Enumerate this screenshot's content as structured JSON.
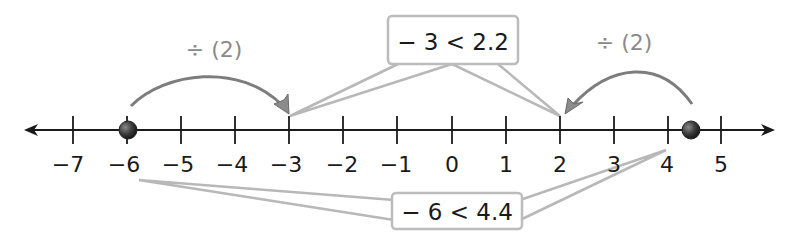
{
  "number_line": {
    "min": -7,
    "max": 5,
    "tick_labels": [
      "−7",
      "−6",
      "−5",
      "−4",
      "−3",
      "−2",
      "−1",
      "0",
      "1",
      "2",
      "3",
      "4",
      "5"
    ],
    "colors": {
      "axis": "#1a1a1a",
      "point": "#3a3a3a",
      "arc": "#7a7a7a",
      "callout_border": "#b5b5b5"
    }
  },
  "points": [
    {
      "value": -6,
      "label": "−6"
    },
    {
      "value": 4.4,
      "label": "4.4"
    }
  ],
  "arrows": [
    {
      "from": -6,
      "to": -3,
      "label": "÷ (2)"
    },
    {
      "from": 4.4,
      "to": 2.2,
      "label": "÷ (2)"
    }
  ],
  "callouts": {
    "top": {
      "text": "− 3 < 2.2"
    },
    "bottom": {
      "text": "− 6 < 4.4"
    }
  }
}
